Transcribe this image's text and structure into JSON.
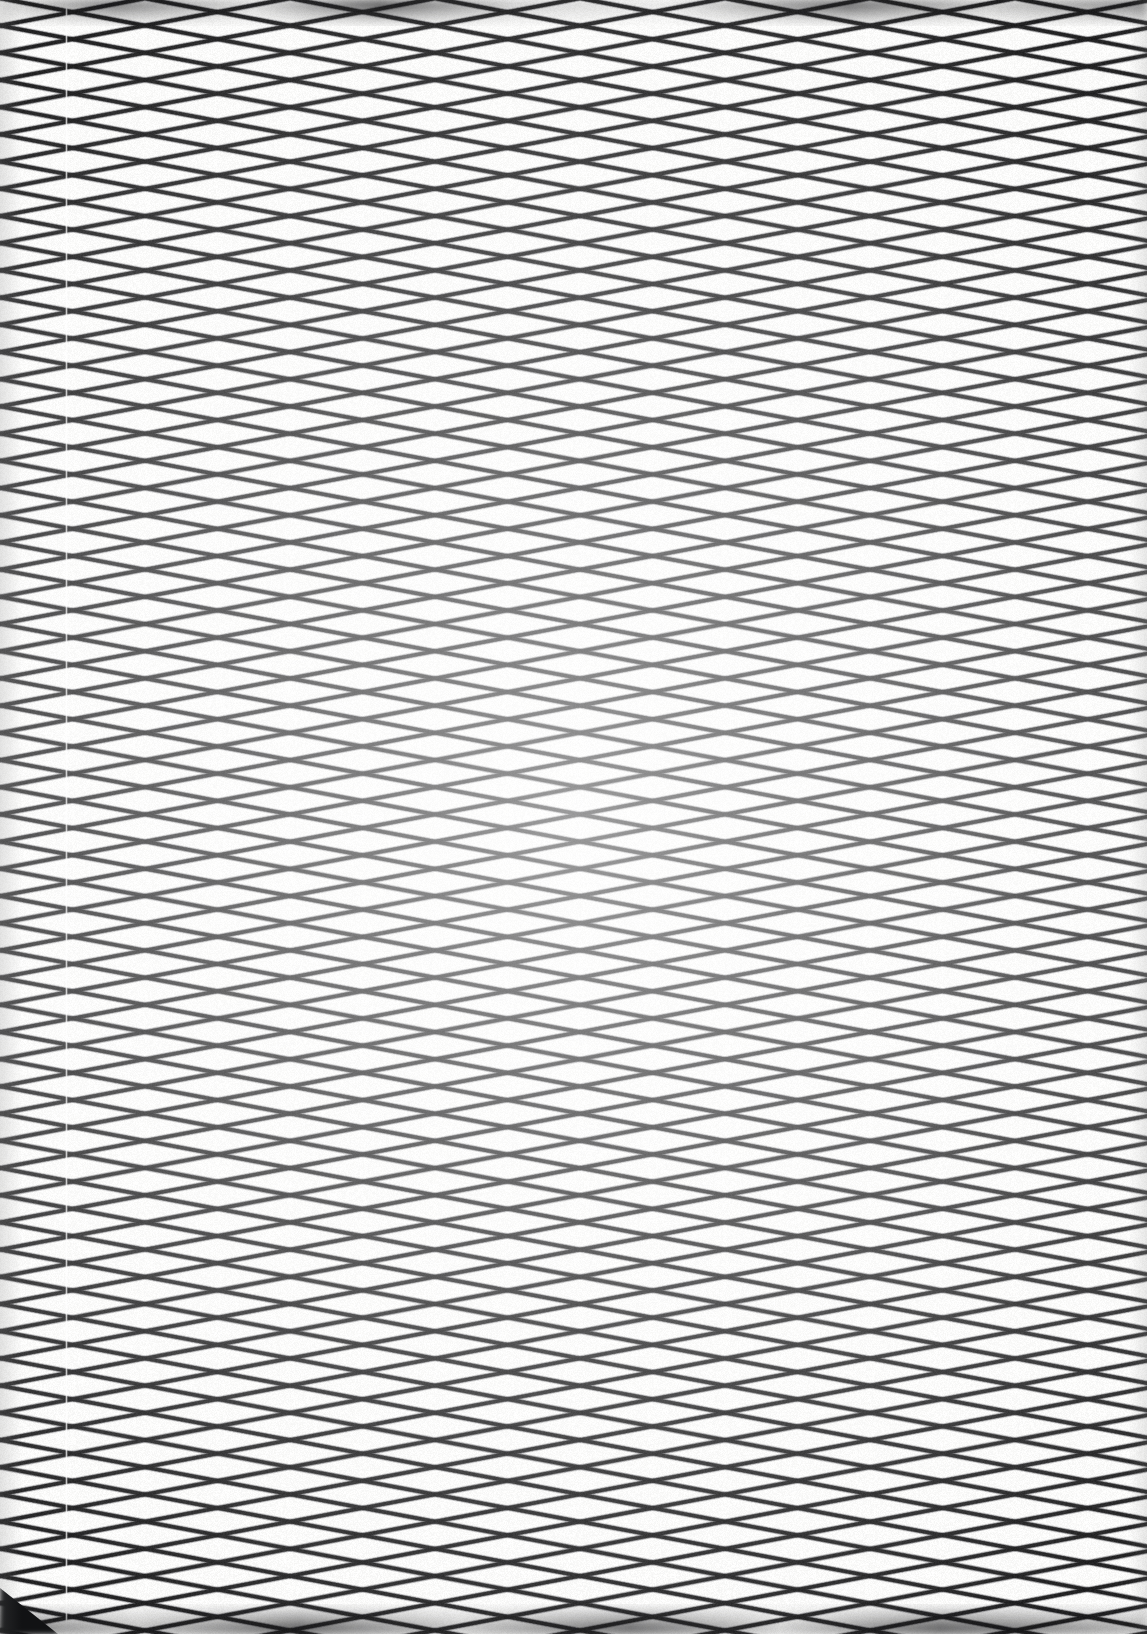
{
  "image": {
    "kind": "photograph",
    "subject_label": "expanded-metal diamond mesh close-up",
    "width": 1147,
    "height": 1634,
    "orientation": "portrait"
  },
  "palette": {
    "background": "#fbfbfa",
    "paper_highlight": "#ffffff",
    "strand_dark": "#1d1d1f",
    "strand_mid": "#3a3a3e",
    "strand_soft": "#5a5a60",
    "edge_shadow": "#131315",
    "corner_shadow": "#111214",
    "seam_highlight": "#ffffff"
  },
  "mesh": {
    "pattern_name": "diamond-lattice",
    "row_count": 61,
    "row_pitch_px": 27.2,
    "node_pitch_px": 290,
    "node_offset_px": 145,
    "strand_width_px": 3.4,
    "strand_blur_px": 0.85,
    "first_row_y_px": 12,
    "slope_description": "two mirrored near-horizontal strand families crossing at regular nodes",
    "amplitude_px": 13.6
  },
  "artifacts": {
    "seam": {
      "label": "vertical scan seam",
      "x_px": 65,
      "width_px": 3,
      "opacity": 0.85
    },
    "top_edge_shadow": {
      "label": "top edge blur band",
      "height_px": 26
    },
    "bottom_edge_shadow": {
      "label": "bottom edge blur band",
      "height_px": 30
    },
    "bottom_left_corner": {
      "label": "bottom-left corner shadow",
      "x_px": 0,
      "y_px": 1578,
      "width_px": 58,
      "height_px": 56
    },
    "vignette": {
      "label": "edge vignette",
      "left_px": 22,
      "right_px": 18
    }
  },
  "caption": {
    "title": "Diamond mesh detail",
    "note": "No interface text present in this frame."
  }
}
